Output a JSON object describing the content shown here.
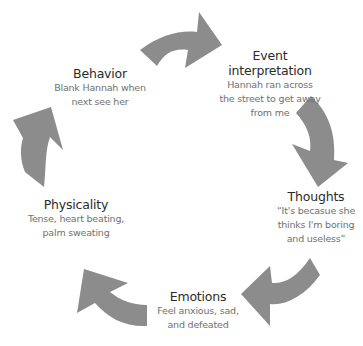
{
  "diagram": {
    "type": "cycle",
    "arrow_color": "#8c8c8c",
    "nodes": [
      {
        "id": "event",
        "title_line1": "Event",
        "title_line2": "interpretation",
        "desc": [
          "Hannah ran across",
          "the street to get away",
          "from me"
        ]
      },
      {
        "id": "thoughts",
        "title": "Thoughts",
        "desc": [
          "“It's becasue she",
          "thinks I'm boring",
          "and useless”"
        ]
      },
      {
        "id": "emotions",
        "title": "Emotions",
        "desc": [
          "Feel anxious, sad,",
          "and defeated"
        ]
      },
      {
        "id": "physicality",
        "title": "Physicality",
        "desc": [
          "Tense, heart beating,",
          "palm sweating"
        ]
      },
      {
        "id": "behavior",
        "title": "Behavior",
        "desc": [
          "Blank Hannah when",
          "next see her"
        ]
      }
    ],
    "edges": [
      {
        "from": "behavior",
        "to": "event"
      },
      {
        "from": "event",
        "to": "thoughts"
      },
      {
        "from": "thoughts",
        "to": "emotions"
      },
      {
        "from": "emotions",
        "to": "physicality"
      },
      {
        "from": "physicality",
        "to": "behavior"
      }
    ]
  }
}
